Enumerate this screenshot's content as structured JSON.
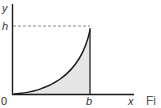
{
  "diagram": {
    "labels": {
      "y_axis": "y",
      "x_axis": "x",
      "height": "h",
      "b_mark": "b",
      "origin": "0",
      "caption_fragment": "Fi"
    },
    "colors": {
      "axis": "#1a1a1a",
      "curve": "#1a1a1a",
      "shade": "#e6e6e6",
      "dashed": "#888888"
    }
  }
}
